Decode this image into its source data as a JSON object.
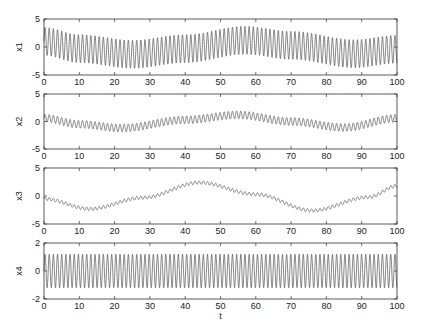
{
  "chart_data": {
    "type": "line",
    "title": "",
    "xlabel": "t",
    "xlim": [
      0,
      100
    ],
    "xticks": [
      0,
      10,
      20,
      30,
      40,
      50,
      60,
      70,
      80,
      90,
      100
    ],
    "grid": false,
    "legend": null,
    "subplots": [
      {
        "ylabel": "x1",
        "ylim": [
          -5,
          5
        ],
        "yticks": [
          -5,
          0,
          5
        ],
        "series": {
          "name": "x1",
          "slow_component": {
            "mean": 0.0,
            "amplitude": -1.3,
            "period": 63,
            "phase_t": 0,
            "note": "center ~+1 at t=0, min ~-1.3 near t=25, max ~+1.2 near t=57, min ~-1.2 near t=88"
          },
          "fast_component": {
            "amplitude": 2.5,
            "period": 1.18
          }
        },
        "approx_points": {
          "t": [
            0,
            10,
            25,
            40,
            57,
            70,
            88,
            100
          ],
          "center": [
            1.0,
            -0.3,
            -1.3,
            -0.3,
            1.2,
            0.3,
            -1.2,
            -0.4
          ],
          "envelope_halfwidth": 2.5
        }
      },
      {
        "ylabel": "x2",
        "ylim": [
          -5,
          5
        ],
        "yticks": [
          -5,
          0,
          5
        ],
        "series": {
          "name": "x2",
          "slow_component": {
            "mean": 0.0,
            "amplitude": 1.2,
            "period": 63
          },
          "fast_component": {
            "amplitude": 0.7,
            "period": 1.18
          }
        },
        "approx_points": {
          "t": [
            0,
            10,
            22,
            40,
            55,
            70,
            85,
            100
          ],
          "center": [
            0.6,
            -0.5,
            -1.2,
            0.3,
            1.2,
            0.0,
            -1.1,
            0.6
          ],
          "envelope_halfwidth": 0.7
        }
      },
      {
        "ylabel": "x3",
        "ylim": [
          -5,
          5
        ],
        "yticks": [
          -5,
          0,
          5
        ],
        "series": {
          "name": "x3",
          "slow_component": {
            "mean": 0.0,
            "amplitude": 2.45,
            "period": 63
          },
          "fast_component": {
            "amplitude": 0.3,
            "period": 1.18
          }
        },
        "approx_points": {
          "t": [
            0,
            13,
            28,
            44,
            60,
            76,
            92,
            100
          ],
          "center": [
            -0.5,
            -2.3,
            -0.3,
            2.4,
            0.3,
            -2.6,
            -0.2,
            1.8
          ],
          "envelope_halfwidth": 0.3
        }
      },
      {
        "ylabel": "x4",
        "ylim": [
          -2,
          2
        ],
        "yticks": [
          -2,
          0,
          2
        ],
        "series": {
          "name": "x4",
          "slow_component": {
            "mean": 0.0,
            "amplitude": 0.0,
            "period": 63
          },
          "fast_component": {
            "amplitude": 1.2,
            "period": 1.18
          }
        },
        "approx_points": {
          "t": [
            0,
            50,
            100
          ],
          "center": [
            0,
            0,
            0
          ],
          "envelope_halfwidth": 1.2
        }
      }
    ]
  },
  "layout": {
    "plot_left": 44,
    "plot_right": 397,
    "panels": [
      {
        "top": 19,
        "bottom": 75
      },
      {
        "top": 94,
        "bottom": 149
      },
      {
        "top": 168,
        "bottom": 224
      },
      {
        "top": 243,
        "bottom": 299
      }
    ],
    "line_color": "#555555",
    "axis_color": "#333333"
  }
}
